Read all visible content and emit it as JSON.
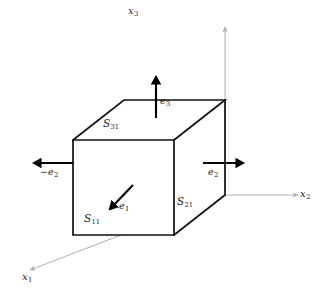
{
  "figure": {
    "background_color": "#ffffff",
    "cube_edge_color": "#111111",
    "axis_color": "#b0b0b0",
    "vector_color": "#000000",
    "label_color": "#1a1a1a"
  },
  "axes": [
    {
      "id": "x1",
      "base": "x",
      "sub": "1",
      "direction": "down-left"
    },
    {
      "id": "x2",
      "base": "x",
      "sub": "2",
      "direction": "right"
    },
    {
      "id": "x3",
      "base": "x",
      "sub": "3",
      "direction": "up"
    }
  ],
  "faces": [
    {
      "id": "S11",
      "base": "S",
      "sub": "11",
      "face": "front"
    },
    {
      "id": "S21",
      "base": "S",
      "sub": "21",
      "face": "right"
    },
    {
      "id": "S31",
      "base": "S",
      "sub": "31",
      "face": "top"
    }
  ],
  "vectors": [
    {
      "id": "e1",
      "sign": "",
      "base": "e",
      "sub": "1",
      "direction": "down-left"
    },
    {
      "id": "e2",
      "sign": "",
      "base": "e",
      "sub": "2",
      "direction": "right"
    },
    {
      "id": "minus_e2",
      "sign": "−",
      "base": "e",
      "sub": "2",
      "direction": "left"
    },
    {
      "id": "e3",
      "sign": "",
      "base": "e",
      "sub": "3",
      "direction": "up"
    }
  ]
}
